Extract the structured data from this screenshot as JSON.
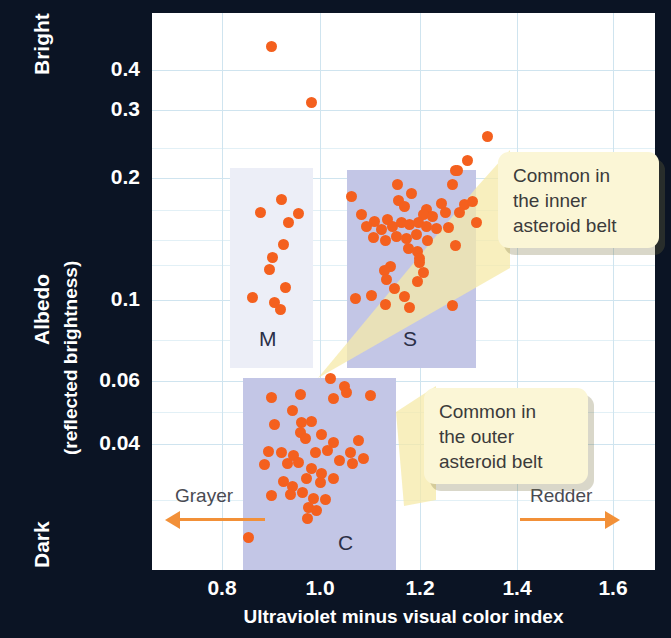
{
  "chart_data": {
    "type": "scatter",
    "title": "",
    "xlabel": "Ultraviolet minus visual color index",
    "ylabel_main": "Albedo",
    "ylabel_sub": "(reflected brightness)",
    "y_axis_top_label": "Bright",
    "y_axis_bottom_label": "Dark",
    "y_scale": "log",
    "yticks": [
      {
        "label": "0.4",
        "value": 0.4,
        "py": 70
      },
      {
        "label": "0.3",
        "value": 0.3,
        "py": 110
      },
      {
        "label": "0.2",
        "value": 0.2,
        "py": 178
      },
      {
        "label": "0.1",
        "value": 0.1,
        "py": 300
      },
      {
        "label": "0.06",
        "value": 0.06,
        "py": 381
      },
      {
        "label": "0.04",
        "value": 0.04,
        "py": 444
      }
    ],
    "xticks": [
      {
        "label": "0.8",
        "value": 0.8,
        "px": 222
      },
      {
        "label": "1.0",
        "value": 1.0,
        "px": 320
      },
      {
        "label": "1.2",
        "value": 1.2,
        "px": 420
      },
      {
        "label": "1.4",
        "value": 1.4,
        "px": 517
      },
      {
        "label": "1.6",
        "value": 1.6,
        "px": 613
      }
    ],
    "xlim": [
      0.67,
      1.75
    ],
    "ylim": [
      0.022,
      0.52
    ],
    "grid": true,
    "marker_color": "#f4601e",
    "marker_size_px": 11,
    "groups": [
      {
        "name": "M",
        "label": "M",
        "band_color": "#eceef7",
        "band_px": {
          "x": 230,
          "y": 168,
          "w": 83,
          "h": 200
        },
        "label_px": {
          "x": 259,
          "y": 327
        },
        "points_px": [
          [
            260,
            212
          ],
          [
            288,
            222
          ],
          [
            298,
            213
          ],
          [
            283,
            244
          ],
          [
            272,
            257
          ],
          [
            269,
            269
          ],
          [
            285,
            287
          ],
          [
            252,
            297
          ],
          [
            274,
            302
          ],
          [
            280,
            309
          ],
          [
            281,
            199
          ]
        ]
      },
      {
        "name": "S",
        "label": "S",
        "band_color": "#c3c6e6",
        "band_px": {
          "x": 347,
          "y": 170,
          "w": 129,
          "h": 198
        },
        "label_px": {
          "x": 403,
          "y": 327
        },
        "points_px": [
          [
            457,
            170
          ],
          [
            397,
            184
          ],
          [
            411,
            193
          ],
          [
            452,
            184
          ],
          [
            351,
            196
          ],
          [
            441,
            203
          ],
          [
            426,
            209
          ],
          [
            398,
            200
          ],
          [
            404,
            206
          ],
          [
            464,
            204
          ],
          [
            472,
            201
          ],
          [
            361,
            214
          ],
          [
            387,
            219
          ],
          [
            374,
            221
          ],
          [
            423,
            214
          ],
          [
            432,
            216
          ],
          [
            445,
            212
          ],
          [
            459,
            212
          ],
          [
            366,
            226
          ],
          [
            381,
            229
          ],
          [
            392,
            226
          ],
          [
            401,
            222
          ],
          [
            409,
            224
          ],
          [
            418,
            222
          ],
          [
            426,
            226
          ],
          [
            436,
            228
          ],
          [
            476,
            222
          ],
          [
            373,
            237
          ],
          [
            385,
            240
          ],
          [
            396,
            236
          ],
          [
            406,
            238
          ],
          [
            416,
            234
          ],
          [
            427,
            240
          ],
          [
            448,
            227
          ],
          [
            408,
            248
          ],
          [
            417,
            251
          ],
          [
            455,
            245
          ],
          [
            419,
            258
          ],
          [
            390,
            266
          ],
          [
            419,
            262
          ],
          [
            384,
            270
          ],
          [
            423,
            272
          ],
          [
            386,
            279
          ],
          [
            417,
            281
          ],
          [
            394,
            288
          ],
          [
            404,
            296
          ],
          [
            371,
            295
          ],
          [
            409,
            307
          ],
          [
            385,
            304
          ],
          [
            452,
            305
          ],
          [
            355,
            298
          ]
        ]
      },
      {
        "name": "C",
        "label": "C",
        "band_color": "#c3c6e6",
        "band_px": {
          "x": 243,
          "y": 378,
          "w": 153,
          "h": 192
        },
        "label_px": {
          "x": 338,
          "y": 531
        },
        "points_px": [
          [
            330,
            378
          ],
          [
            344,
            386
          ],
          [
            271,
            397
          ],
          [
            300,
            394
          ],
          [
            333,
            398
          ],
          [
            346,
            392
          ],
          [
            370,
            395
          ],
          [
            292,
            410
          ],
          [
            274,
            424
          ],
          [
            301,
            422
          ],
          [
            311,
            421
          ],
          [
            300,
            432
          ],
          [
            305,
            438
          ],
          [
            321,
            434
          ],
          [
            333,
            442
          ],
          [
            358,
            440
          ],
          [
            350,
            452
          ],
          [
            268,
            451
          ],
          [
            281,
            452
          ],
          [
            293,
            455
          ],
          [
            315,
            452
          ],
          [
            327,
            450
          ],
          [
            298,
            462
          ],
          [
            339,
            460
          ],
          [
            352,
            463
          ],
          [
            363,
            458
          ],
          [
            287,
            463
          ],
          [
            264,
            464
          ],
          [
            311,
            468
          ],
          [
            321,
            473
          ],
          [
            306,
            478
          ],
          [
            283,
            481
          ],
          [
            292,
            486
          ],
          [
            320,
            482
          ],
          [
            333,
            478
          ],
          [
            271,
            495
          ],
          [
            290,
            494
          ],
          [
            302,
            492
          ],
          [
            313,
            498
          ],
          [
            308,
            507
          ],
          [
            316,
            510
          ],
          [
            325,
            499
          ],
          [
            307,
            518
          ],
          [
            248,
            537
          ]
        ]
      },
      {
        "name": "outliers",
        "label": "",
        "band_color": "",
        "band_px": null,
        "label_px": null,
        "points_px": [
          [
            271,
            46
          ],
          [
            311,
            102
          ],
          [
            487,
            136
          ],
          [
            467,
            160
          ],
          [
            455,
            170
          ]
        ]
      }
    ],
    "callouts": [
      {
        "id": "inner-belt",
        "text_lines": [
          "Common in",
          "the inner",
          "asteroid belt"
        ],
        "box_px": {
          "x": 498,
          "y": 152,
          "w": 161,
          "h": 96
        },
        "color": "#fbf6d6",
        "points_to": "S"
      },
      {
        "id": "outer-belt",
        "text_lines": [
          "Common in",
          "the outer",
          "asteroid belt"
        ],
        "box_px": {
          "x": 424,
          "y": 388,
          "w": 164,
          "h": 96
        },
        "color": "#fbf6d6",
        "points_to": "C"
      }
    ],
    "annotations": [
      {
        "id": "grayer",
        "text": "Grayer",
        "direction": "left",
        "color": "#f29038",
        "px": {
          "x": 175,
          "y": 485
        }
      },
      {
        "id": "redder",
        "text": "Redder",
        "direction": "right",
        "color": "#f29038",
        "px": {
          "x": 530,
          "y": 485
        }
      }
    ]
  },
  "axis": {
    "y_top": "Bright",
    "y_bottom": "Dark",
    "y_title_line1": "Albedo",
    "y_title_line2": "(reflected brightness)",
    "x_title": "Ultraviolet minus visual color index"
  },
  "background_color": "#0b1424",
  "plot_background": "#ffffff"
}
